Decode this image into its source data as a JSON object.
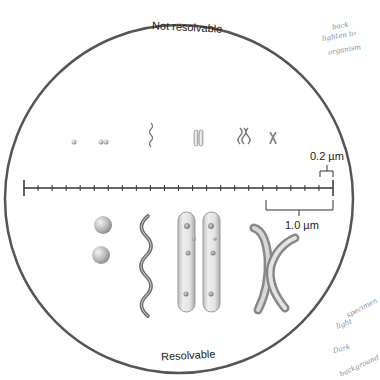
{
  "diagram": {
    "top_label": "Not resolvable",
    "bottom_label": "Resolvable",
    "scale_small_label": "0.2 µm",
    "scale_large_label": "1.0 µm",
    "circle_color": "#555555",
    "ruler": {
      "x_start": 24,
      "x_end": 333,
      "y": 188,
      "segments": 22,
      "unit_per_segment": "0.2 µm"
    },
    "small_specimens": [
      {
        "name": "single-coccus",
        "x": 74
      },
      {
        "name": "diplococcus",
        "x": 103
      },
      {
        "name": "spirillum",
        "x": 151
      },
      {
        "name": "bacillus-pair",
        "x": 197
      },
      {
        "name": "filament-cluster",
        "x": 244
      },
      {
        "name": "cross-filament",
        "x": 273
      }
    ],
    "large_specimens": [
      {
        "name": "cocci-pair"
      },
      {
        "name": "spirillum"
      },
      {
        "name": "bacilli-pair"
      },
      {
        "name": "crossed-filaments"
      }
    ]
  },
  "annotations": {
    "top_right": [
      "back",
      "lighten to",
      "organism"
    ],
    "bottom_right": [
      "specimen",
      "light",
      "Dark",
      "background"
    ]
  }
}
